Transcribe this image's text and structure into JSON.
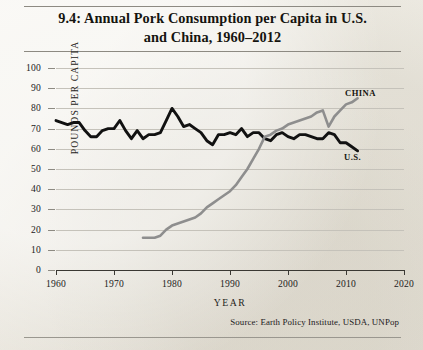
{
  "figure": {
    "title_line1": "9.4: Annual Pork Consumption per Capita in U.S.",
    "title_line2": "and China, 1960–2012",
    "source": "Source: Earth Policy Institute, USDA, UNPop"
  },
  "chart_data": {
    "type": "line",
    "title": "9.4: Annual Pork Consumption per Capita in U.S. and China, 1960–2012",
    "xlabel": "YEAR",
    "ylabel": "POUNDS PER CAPITA",
    "xlim": [
      1960,
      2020
    ],
    "ylim": [
      0,
      100
    ],
    "xticks": [
      1960,
      1970,
      1980,
      1990,
      2000,
      2010,
      2020
    ],
    "yticks": [
      0,
      10,
      20,
      30,
      40,
      50,
      60,
      70,
      80,
      90,
      100
    ],
    "grid": true,
    "legend_position": "inline-right",
    "series": [
      {
        "name": "U.S.",
        "color": "#111111",
        "width": 2.9,
        "x": [
          1960,
          1961,
          1962,
          1963,
          1964,
          1965,
          1966,
          1967,
          1968,
          1969,
          1970,
          1971,
          1972,
          1973,
          1974,
          1975,
          1976,
          1977,
          1978,
          1979,
          1980,
          1981,
          1982,
          1983,
          1984,
          1985,
          1986,
          1987,
          1988,
          1989,
          1990,
          1991,
          1992,
          1993,
          1994,
          1995,
          1996,
          1997,
          1998,
          1999,
          2000,
          2001,
          2002,
          2003,
          2004,
          2005,
          2006,
          2007,
          2008,
          2009,
          2010,
          2011,
          2012
        ],
        "values": [
          74,
          73,
          72,
          73,
          73,
          69,
          66,
          66,
          69,
          70,
          70,
          74,
          69,
          65,
          69,
          65,
          67,
          67,
          68,
          74,
          80,
          76,
          71,
          72,
          70,
          68,
          64,
          62,
          67,
          67,
          68,
          67,
          70,
          66,
          68,
          68,
          65,
          64,
          67,
          68,
          66,
          65,
          67,
          67,
          66,
          65,
          65,
          68,
          67,
          63,
          63,
          61,
          59
        ]
      },
      {
        "name": "CHINA",
        "color": "#8e8e8e",
        "width": 2.6,
        "x": [
          1975,
          1976,
          1977,
          1978,
          1979,
          1980,
          1981,
          1982,
          1983,
          1984,
          1985,
          1986,
          1987,
          1988,
          1989,
          1990,
          1991,
          1992,
          1993,
          1994,
          1995,
          1996,
          1997,
          1998,
          1999,
          2000,
          2001,
          2002,
          2003,
          2004,
          2005,
          2006,
          2007,
          2008,
          2009,
          2010,
          2011,
          2012
        ],
        "values": [
          16,
          16,
          16,
          17,
          20,
          22,
          23,
          24,
          25,
          26,
          28,
          31,
          33,
          35,
          37,
          39,
          42,
          46,
          50,
          55,
          60,
          66,
          67,
          69,
          70,
          72,
          73,
          74,
          75,
          76,
          78,
          79,
          71,
          76,
          79,
          82,
          83,
          85
        ]
      }
    ]
  },
  "axis": {
    "xticks": [
      "1960",
      "1970",
      "1980",
      "1990",
      "2000",
      "2010",
      "2020"
    ],
    "yticks": [
      "100",
      "90",
      "80",
      "70",
      "60",
      "50",
      "40",
      "30",
      "20",
      "10",
      "0"
    ],
    "xlabel": "YEAR",
    "ylabel": "POUNDS PER CAPITA"
  },
  "labels": {
    "china": "CHINA",
    "us": "U.S."
  }
}
